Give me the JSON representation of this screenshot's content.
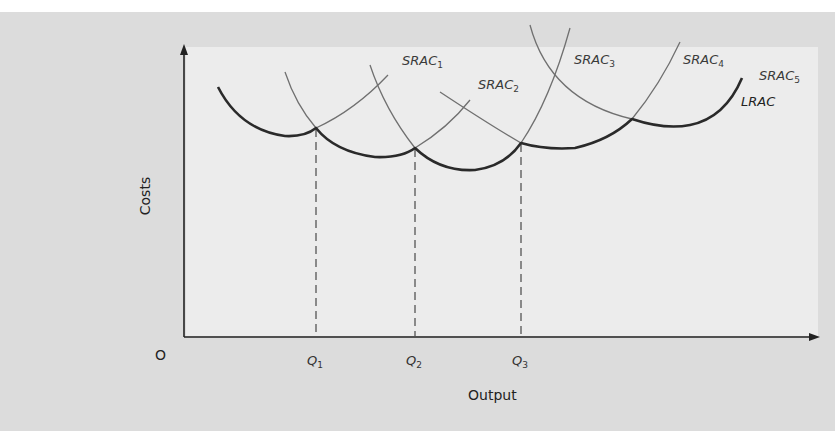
{
  "diagram": {
    "type": "economics-cost-curves",
    "y_axis_label": "Costs",
    "x_axis_label": "Output",
    "origin_label": "O",
    "quantities": [
      {
        "base": "Q",
        "sub": "1"
      },
      {
        "base": "Q",
        "sub": "2"
      },
      {
        "base": "Q",
        "sub": "3"
      }
    ],
    "curves": [
      {
        "base": "SRAC",
        "sub": "1"
      },
      {
        "base": "SRAC",
        "sub": "2"
      },
      {
        "base": "SRAC",
        "sub": "3"
      },
      {
        "base": "SRAC",
        "sub": "4"
      },
      {
        "base": "SRAC",
        "sub": "5"
      }
    ],
    "envelope_label": "LRAC",
    "colors": {
      "outer_background": "#dcdcdc",
      "panel_background": "#ececec",
      "lrac_stroke": "#2a2a2a",
      "srac_stroke": "#6e6e6e",
      "axis_stroke": "#222222"
    }
  }
}
